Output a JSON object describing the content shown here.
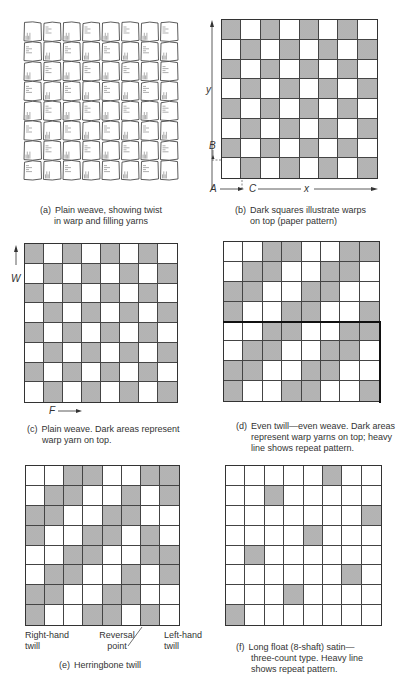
{
  "figures": {
    "a": {
      "tag": "(a)",
      "caption_line1": "Plain weave, showing twist",
      "caption_line2": "in warp and filling yarns"
    },
    "b": {
      "tag": "(b)",
      "caption_line1": "Dark squares illustrate warps",
      "caption_line2": "on top (paper pattern)",
      "labels": {
        "y": "y",
        "B": "B",
        "A": "A",
        "C": "C",
        "x": "x"
      },
      "pattern": [
        [
          1,
          0,
          1,
          0,
          1,
          0,
          1,
          0
        ],
        [
          0,
          1,
          0,
          1,
          0,
          1,
          0,
          1
        ],
        [
          1,
          0,
          1,
          0,
          1,
          0,
          1,
          0
        ],
        [
          0,
          1,
          0,
          1,
          0,
          1,
          0,
          1
        ],
        [
          1,
          0,
          1,
          0,
          1,
          0,
          1,
          0
        ],
        [
          0,
          1,
          0,
          1,
          0,
          1,
          0,
          1
        ],
        [
          1,
          0,
          1,
          0,
          1,
          0,
          1,
          0
        ],
        [
          0,
          1,
          0,
          1,
          0,
          1,
          0,
          1
        ]
      ]
    },
    "c": {
      "tag": "(c)",
      "caption_line1": "Plain weave.  Dark areas represent",
      "caption_line2": "warp yarn on top.",
      "labels": {
        "W": "W",
        "F": "F"
      },
      "pattern": [
        [
          1,
          0,
          1,
          0,
          1,
          0,
          1,
          0
        ],
        [
          0,
          1,
          0,
          1,
          0,
          1,
          0,
          1
        ],
        [
          1,
          0,
          1,
          0,
          1,
          0,
          1,
          0
        ],
        [
          0,
          1,
          0,
          1,
          0,
          1,
          0,
          1
        ],
        [
          1,
          0,
          1,
          0,
          1,
          0,
          1,
          0
        ],
        [
          0,
          1,
          0,
          1,
          0,
          1,
          0,
          1
        ],
        [
          1,
          0,
          1,
          0,
          1,
          0,
          1,
          0
        ],
        [
          0,
          1,
          0,
          1,
          0,
          1,
          0,
          1
        ]
      ]
    },
    "d": {
      "tag": "(d)",
      "caption_line1": "Even twill—even weave.  Dark areas",
      "caption_line2": "represent warp yarns on top; heavy",
      "caption_line3": "line shows repeat pattern.",
      "pattern": [
        [
          0,
          0,
          1,
          1,
          0,
          0,
          1,
          1
        ],
        [
          0,
          1,
          1,
          0,
          0,
          1,
          1,
          0
        ],
        [
          1,
          1,
          0,
          0,
          1,
          1,
          0,
          0
        ],
        [
          1,
          0,
          0,
          1,
          1,
          0,
          0,
          1
        ],
        [
          0,
          0,
          1,
          1,
          0,
          0,
          1,
          1
        ],
        [
          0,
          1,
          1,
          0,
          0,
          1,
          1,
          0
        ],
        [
          1,
          1,
          0,
          0,
          1,
          1,
          0,
          0
        ],
        [
          1,
          0,
          0,
          1,
          1,
          0,
          0,
          1
        ]
      ]
    },
    "e": {
      "tag": "(e)",
      "caption_line1": "Herringbone twill",
      "labels": {
        "right_hand_1": "Right-hand",
        "right_hand_2": "twill",
        "reversal_1": "Reversal",
        "reversal_2": "point",
        "left_hand_1": "Left-hand",
        "left_hand_2": "twill"
      },
      "pattern": [
        [
          0,
          0,
          1,
          1,
          0,
          0,
          1,
          1
        ],
        [
          0,
          1,
          1,
          0,
          0,
          1,
          0,
          1
        ],
        [
          1,
          1,
          0,
          0,
          1,
          1,
          0,
          0
        ],
        [
          1,
          0,
          0,
          1,
          1,
          0,
          1,
          0
        ],
        [
          0,
          0,
          1,
          1,
          0,
          0,
          1,
          1
        ],
        [
          0,
          1,
          1,
          0,
          0,
          1,
          0,
          1
        ],
        [
          1,
          1,
          0,
          0,
          1,
          1,
          0,
          0
        ],
        [
          1,
          0,
          0,
          1,
          1,
          0,
          1,
          0
        ]
      ]
    },
    "f": {
      "tag": "(f)",
      "caption_line1": "Long float (8-shaft) satin—",
      "caption_line2": "three-count type.  Heavy line",
      "caption_line3": "shows repeat pattern.",
      "pattern": [
        [
          0,
          0,
          0,
          0,
          0,
          1,
          0,
          0
        ],
        [
          0,
          0,
          1,
          0,
          0,
          0,
          0,
          0
        ],
        [
          0,
          0,
          0,
          0,
          0,
          0,
          0,
          1
        ],
        [
          0,
          0,
          0,
          0,
          1,
          0,
          0,
          0
        ],
        [
          0,
          1,
          0,
          0,
          0,
          0,
          0,
          0
        ],
        [
          0,
          0,
          0,
          0,
          0,
          0,
          1,
          0
        ],
        [
          0,
          0,
          0,
          1,
          0,
          0,
          0,
          0
        ],
        [
          1,
          0,
          0,
          0,
          0,
          0,
          0,
          0
        ]
      ]
    }
  }
}
